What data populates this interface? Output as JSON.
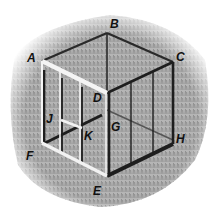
{
  "figure": {
    "colors": {
      "grass_light": "#c9c9c9",
      "grass_dark": "#8a8a8a",
      "frame_dark": "#1e1e1e",
      "frame_light": "#f2f2f2",
      "label": "#111111"
    },
    "labels": [
      {
        "id": "A",
        "text": "A",
        "x": 27,
        "y": 62
      },
      {
        "id": "B",
        "text": "B",
        "x": 110,
        "y": 28
      },
      {
        "id": "C",
        "text": "C",
        "x": 176,
        "y": 61
      },
      {
        "id": "D",
        "text": "D",
        "x": 93,
        "y": 102
      },
      {
        "id": "J",
        "text": "J",
        "x": 46,
        "y": 123
      },
      {
        "id": "K",
        "text": "K",
        "x": 84,
        "y": 140
      },
      {
        "id": "G",
        "text": "G",
        "x": 111,
        "y": 131
      },
      {
        "id": "H",
        "text": "H",
        "x": 176,
        "y": 143
      },
      {
        "id": "F",
        "text": "F",
        "x": 26,
        "y": 160
      },
      {
        "id": "E",
        "text": "E",
        "x": 93,
        "y": 195
      }
    ]
  }
}
